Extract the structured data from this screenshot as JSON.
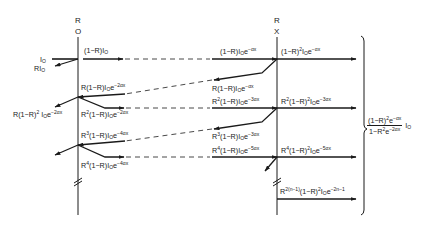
{
  "diagram": {
    "type": "multiple-reflection ray diagram",
    "interfaces": [
      {
        "id": "front",
        "label_top": "R",
        "label_bottom": "O",
        "position": "x=0"
      },
      {
        "id": "back",
        "label_top": "R",
        "label_bottom": "X",
        "position": "x"
      }
    ],
    "incident": {
      "label": "I",
      "sub": "O"
    },
    "reflected_incident": {
      "label": "RI",
      "sub": "O"
    },
    "labels": {
      "t1": "(1−R)I₀",
      "t1_at_x": "(1−R)I₀e^(−αx)",
      "out1": "(1−R)²I₀e^(−αx)",
      "r1_back": "R(1−R)I₀e^(−αx)",
      "r1_front": "R(1−R)I₀e^(−2αx)",
      "refl_out1": "R(1−R)²I₀e^(−2αx)",
      "f2": "R²(1−R)I₀e^(−2αx)",
      "f2_at_x": "R²(1−R)I₀e^(−3αx)",
      "out2": "R²(1−R)²I₀e^(−3αx)",
      "r2_back": "R³(1−R)I₀e^(−3αx)",
      "r2_front": "R³(1−R)I₀e^(−4αx)",
      "f3": "R⁴(1−R)I₀e^(−4αx)",
      "f3_at_x": "R⁴(1−R)I₀e^(−5αx)",
      "out3": "R⁴(1−R)²I₀e^(−5αx)",
      "outn": "R^(2(n−1))(1−R)²I₀e^(−2n−1)"
    },
    "sum": {
      "numerator": "(1−R)²e^(−αx)",
      "denominator": "1−R²e^(−2αx)",
      "factor": "I₀"
    }
  }
}
